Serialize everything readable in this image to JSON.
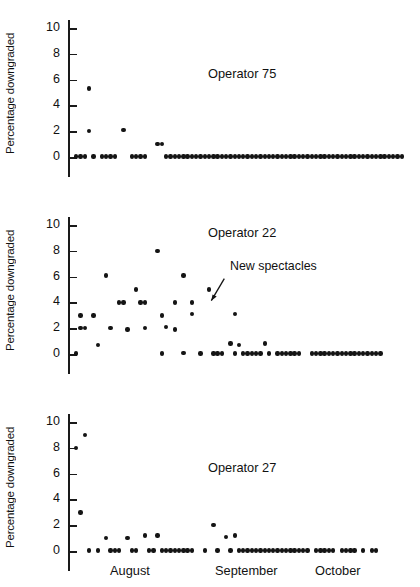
{
  "chart_data": {
    "type": "scatter",
    "title": "",
    "xlabel": "",
    "ylabel": "Percentage downgraded",
    "ylim": [
      0,
      10
    ],
    "yticks": [
      0,
      2,
      4,
      6,
      8,
      10
    ],
    "ytick_labels": [
      "0",
      "2",
      "4",
      "6",
      "8",
      "10"
    ],
    "grid": false,
    "legend": "none",
    "x_category_labels": [
      "August",
      "September",
      "October"
    ],
    "x_axis_note": "Daily observations spanning August through October; x tick labels are month names only",
    "panels": [
      {
        "name": "Operator 75",
        "label_position": "upper-right",
        "points": [
          {
            "x": 1,
            "y": 0.05
          },
          {
            "x": 2,
            "y": 0.05
          },
          {
            "x": 3,
            "y": 0.05
          },
          {
            "x": 4,
            "y": 5.3
          },
          {
            "x": 4,
            "y": 2.0
          },
          {
            "x": 5,
            "y": 0.05
          },
          {
            "x": 7,
            "y": 0.05
          },
          {
            "x": 8,
            "y": 0.05
          },
          {
            "x": 9,
            "y": 0.05
          },
          {
            "x": 10,
            "y": 0.05
          },
          {
            "x": 12,
            "y": 2.1
          },
          {
            "x": 14,
            "y": 0.05
          },
          {
            "x": 15,
            "y": 0.05
          },
          {
            "x": 16,
            "y": 0.05
          },
          {
            "x": 17,
            "y": 0.05
          },
          {
            "x": 20,
            "y": 1.0
          },
          {
            "x": 21,
            "y": 1.0
          },
          {
            "x": 22,
            "y": 0.05
          },
          {
            "x": 23,
            "y": 0.05
          },
          {
            "x": 24,
            "y": 0.05
          },
          {
            "x": 25,
            "y": 0.05
          },
          {
            "x": 26,
            "y": 0.05
          },
          {
            "x": 27,
            "y": 0.05
          },
          {
            "x": 28,
            "y": 0.05
          },
          {
            "x": 29,
            "y": 0.05
          },
          {
            "x": 30,
            "y": 0.05
          },
          {
            "x": 31,
            "y": 0.05
          },
          {
            "x": 32,
            "y": 0.05
          },
          {
            "x": 33,
            "y": 0.05
          },
          {
            "x": 34,
            "y": 0.05
          },
          {
            "x": 35,
            "y": 0.05
          },
          {
            "x": 36,
            "y": 0.05
          },
          {
            "x": 37,
            "y": 0.05
          },
          {
            "x": 38,
            "y": 0.05
          },
          {
            "x": 39,
            "y": 0.05
          },
          {
            "x": 40,
            "y": 0.05
          },
          {
            "x": 41,
            "y": 0.05
          },
          {
            "x": 42,
            "y": 0.05
          },
          {
            "x": 43,
            "y": 0.05
          },
          {
            "x": 44,
            "y": 0.05
          },
          {
            "x": 45,
            "y": 0.05
          },
          {
            "x": 46,
            "y": 0.05
          },
          {
            "x": 47,
            "y": 0.05
          },
          {
            "x": 48,
            "y": 0.05
          },
          {
            "x": 49,
            "y": 0.05
          },
          {
            "x": 50,
            "y": 0.05
          },
          {
            "x": 51,
            "y": 0.05
          },
          {
            "x": 52,
            "y": 0.05
          },
          {
            "x": 53,
            "y": 0.05
          },
          {
            "x": 54,
            "y": 0.05
          },
          {
            "x": 55,
            "y": 0.05
          },
          {
            "x": 56,
            "y": 0.05
          },
          {
            "x": 57,
            "y": 0.05
          },
          {
            "x": 58,
            "y": 0.05
          },
          {
            "x": 59,
            "y": 0.05
          },
          {
            "x": 60,
            "y": 0.05
          },
          {
            "x": 61,
            "y": 0.05
          },
          {
            "x": 62,
            "y": 0.05
          },
          {
            "x": 63,
            "y": 0.05
          },
          {
            "x": 64,
            "y": 0.05
          },
          {
            "x": 65,
            "y": 0.05
          },
          {
            "x": 66,
            "y": 0.05
          },
          {
            "x": 67,
            "y": 0.05
          },
          {
            "x": 68,
            "y": 0.05
          },
          {
            "x": 69,
            "y": 0.05
          },
          {
            "x": 70,
            "y": 0.05
          },
          {
            "x": 71,
            "y": 0.05
          },
          {
            "x": 72,
            "y": 0.05
          },
          {
            "x": 73,
            "y": 0.05
          },
          {
            "x": 74,
            "y": 0.05
          },
          {
            "x": 75,
            "y": 0.05
          },
          {
            "x": 76,
            "y": 0.05
          },
          {
            "x": 77,
            "y": 0.05
          }
        ],
        "annotation": null
      },
      {
        "name": "Operator 22",
        "label_position": "upper-right",
        "points": [
          {
            "x": 1,
            "y": 0.05
          },
          {
            "x": 2,
            "y": 3.0
          },
          {
            "x": 2,
            "y": 2.0
          },
          {
            "x": 3,
            "y": 2.0
          },
          {
            "x": 5,
            "y": 3.0
          },
          {
            "x": 6,
            "y": 0.7
          },
          {
            "x": 8,
            "y": 6.1
          },
          {
            "x": 9,
            "y": 2.0
          },
          {
            "x": 11,
            "y": 4.0
          },
          {
            "x": 12,
            "y": 4.0
          },
          {
            "x": 13,
            "y": 1.9
          },
          {
            "x": 15,
            "y": 5.0
          },
          {
            "x": 16,
            "y": 4.0
          },
          {
            "x": 17,
            "y": 4.0
          },
          {
            "x": 17,
            "y": 2.0
          },
          {
            "x": 20,
            "y": 8.0
          },
          {
            "x": 21,
            "y": 3.0
          },
          {
            "x": 21,
            "y": 0.05
          },
          {
            "x": 22,
            "y": 2.1
          },
          {
            "x": 24,
            "y": 4.0
          },
          {
            "x": 24,
            "y": 1.9
          },
          {
            "x": 26,
            "y": 6.1
          },
          {
            "x": 26,
            "y": 0.1
          },
          {
            "x": 28,
            "y": 4.0
          },
          {
            "x": 28,
            "y": 3.1
          },
          {
            "x": 30,
            "y": 0.05
          },
          {
            "x": 32,
            "y": 5.0
          },
          {
            "x": 33,
            "y": 0.05
          },
          {
            "x": 34,
            "y": 0.05
          },
          {
            "x": 35,
            "y": 0.05
          },
          {
            "x": 37,
            "y": 0.8
          },
          {
            "x": 38,
            "y": 3.1
          },
          {
            "x": 38,
            "y": 0.05
          },
          {
            "x": 39,
            "y": 0.7
          },
          {
            "x": 40,
            "y": 0.05
          },
          {
            "x": 41,
            "y": 0.05
          },
          {
            "x": 42,
            "y": 0.05
          },
          {
            "x": 43,
            "y": 0.05
          },
          {
            "x": 44,
            "y": 0.05
          },
          {
            "x": 45,
            "y": 0.8
          },
          {
            "x": 46,
            "y": 0.05
          },
          {
            "x": 48,
            "y": 0.05
          },
          {
            "x": 49,
            "y": 0.05
          },
          {
            "x": 50,
            "y": 0.05
          },
          {
            "x": 51,
            "y": 0.05
          },
          {
            "x": 52,
            "y": 0.05
          },
          {
            "x": 53,
            "y": 0.05
          },
          {
            "x": 56,
            "y": 0.05
          },
          {
            "x": 57,
            "y": 0.05
          },
          {
            "x": 58,
            "y": 0.05
          },
          {
            "x": 59,
            "y": 0.05
          },
          {
            "x": 60,
            "y": 0.05
          },
          {
            "x": 61,
            "y": 0.05
          },
          {
            "x": 62,
            "y": 0.05
          },
          {
            "x": 63,
            "y": 0.05
          },
          {
            "x": 64,
            "y": 0.05
          },
          {
            "x": 65,
            "y": 0.05
          },
          {
            "x": 66,
            "y": 0.05
          },
          {
            "x": 67,
            "y": 0.05
          },
          {
            "x": 68,
            "y": 0.05
          },
          {
            "x": 69,
            "y": 0.05
          },
          {
            "x": 70,
            "y": 0.05
          },
          {
            "x": 71,
            "y": 0.05
          },
          {
            "x": 72,
            "y": 0.05
          }
        ],
        "annotation": {
          "text": "New spectacles",
          "points_to_x": 33,
          "points_to_y": 4.6
        }
      },
      {
        "name": "Operator 27",
        "label_position": "upper-right",
        "points": [
          {
            "x": 1,
            "y": 8.0
          },
          {
            "x": 3,
            "y": 9.0
          },
          {
            "x": 2,
            "y": 3.0
          },
          {
            "x": 4,
            "y": 0.05
          },
          {
            "x": 6,
            "y": 0.05
          },
          {
            "x": 8,
            "y": 1.0
          },
          {
            "x": 9,
            "y": 0.05
          },
          {
            "x": 10,
            "y": 0.05
          },
          {
            "x": 11,
            "y": 0.05
          },
          {
            "x": 13,
            "y": 1.0
          },
          {
            "x": 14,
            "y": 0.05
          },
          {
            "x": 15,
            "y": 0.05
          },
          {
            "x": 17,
            "y": 1.2
          },
          {
            "x": 18,
            "y": 0.05
          },
          {
            "x": 19,
            "y": 0.05
          },
          {
            "x": 20,
            "y": 1.2
          },
          {
            "x": 21,
            "y": 0.05
          },
          {
            "x": 22,
            "y": 0.05
          },
          {
            "x": 23,
            "y": 0.05
          },
          {
            "x": 24,
            "y": 0.05
          },
          {
            "x": 25,
            "y": 0.05
          },
          {
            "x": 26,
            "y": 0.05
          },
          {
            "x": 27,
            "y": 0.05
          },
          {
            "x": 28,
            "y": 0.05
          },
          {
            "x": 31,
            "y": 0.05
          },
          {
            "x": 34,
            "y": 0.05
          },
          {
            "x": 33,
            "y": 2.0
          },
          {
            "x": 36,
            "y": 1.1
          },
          {
            "x": 38,
            "y": 1.2
          },
          {
            "x": 37,
            "y": 0.05
          },
          {
            "x": 39,
            "y": 0.05
          },
          {
            "x": 40,
            "y": 0.05
          },
          {
            "x": 41,
            "y": 0.05
          },
          {
            "x": 42,
            "y": 0.05
          },
          {
            "x": 43,
            "y": 0.05
          },
          {
            "x": 44,
            "y": 0.05
          },
          {
            "x": 45,
            "y": 0.05
          },
          {
            "x": 46,
            "y": 0.05
          },
          {
            "x": 47,
            "y": 0.05
          },
          {
            "x": 48,
            "y": 0.05
          },
          {
            "x": 49,
            "y": 0.05
          },
          {
            "x": 50,
            "y": 0.05
          },
          {
            "x": 51,
            "y": 0.05
          },
          {
            "x": 52,
            "y": 0.05
          },
          {
            "x": 53,
            "y": 0.05
          },
          {
            "x": 54,
            "y": 0.05
          },
          {
            "x": 55,
            "y": 0.05
          },
          {
            "x": 57,
            "y": 0.05
          },
          {
            "x": 58,
            "y": 0.05
          },
          {
            "x": 59,
            "y": 0.05
          },
          {
            "x": 60,
            "y": 0.05
          },
          {
            "x": 61,
            "y": 0.05
          },
          {
            "x": 63,
            "y": 0.05
          },
          {
            "x": 64,
            "y": 0.05
          },
          {
            "x": 65,
            "y": 0.05
          },
          {
            "x": 66,
            "y": 0.05
          },
          {
            "x": 68,
            "y": 0.05
          },
          {
            "x": 70,
            "y": 0.05
          },
          {
            "x": 71,
            "y": 0.05
          }
        ],
        "annotation": null
      }
    ]
  },
  "axis": {
    "month_labels": [
      {
        "label": "August",
        "x_px": 110
      },
      {
        "label": "September",
        "x_px": 215
      },
      {
        "label": "October",
        "x_px": 315
      }
    ]
  }
}
